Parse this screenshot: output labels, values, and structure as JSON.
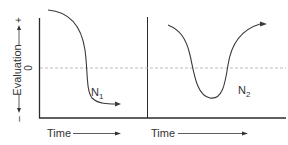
{
  "diagram": {
    "y_axis": {
      "label": "Evaluation",
      "positive": "+",
      "negative": "–",
      "zero": "0"
    },
    "panels": [
      {
        "id": "N1",
        "curve_label_main": "N",
        "curve_label_sub": "1",
        "x_label": "Time",
        "description": "Evaluation starts high and falls below zero, ending negative"
      },
      {
        "id": "N2",
        "curve_label_main": "N",
        "curve_label_sub": "2",
        "x_label": "Time",
        "description": "Evaluation starts high, dips below zero, then recovers above starting level"
      }
    ],
    "colors": {
      "axis": "#2b2b2b",
      "curve": "#3a3a3a",
      "zero_line": "#aaaaaa"
    }
  }
}
